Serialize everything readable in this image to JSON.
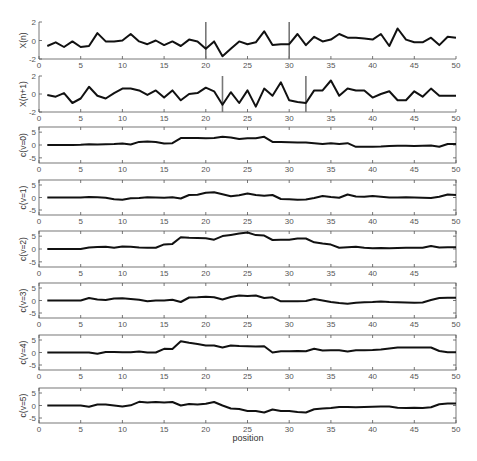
{
  "figure": {
    "xlabel": "position",
    "xlim": [
      0,
      50
    ],
    "xticks": [
      0,
      5,
      10,
      15,
      20,
      25,
      30,
      35,
      40,
      45,
      50
    ]
  },
  "chart_data": [
    {
      "type": "line",
      "title": "",
      "ylabel": "X(n)",
      "xlabel": "",
      "ylim": [
        -2,
        2
      ],
      "yticks": [
        -2,
        0,
        2
      ],
      "frame": "axes-only",
      "markers": [
        20,
        30
      ],
      "x": [
        1,
        2,
        3,
        4,
        5,
        6,
        7,
        8,
        9,
        10,
        11,
        12,
        13,
        14,
        15,
        16,
        17,
        18,
        19,
        20,
        21,
        22,
        23,
        24,
        25,
        26,
        27,
        28,
        29,
        30,
        31,
        32,
        33,
        34,
        35,
        36,
        37,
        38,
        39,
        40,
        41,
        42,
        43,
        44,
        45,
        46,
        47,
        48,
        49,
        50
      ],
      "values": [
        -0.6,
        -0.2,
        -0.7,
        -0.1,
        -0.7,
        -0.6,
        0.8,
        -0.1,
        -0.1,
        0.0,
        0.7,
        -0.1,
        -0.4,
        0.0,
        -0.5,
        -0.1,
        -0.6,
        0.1,
        -0.1,
        -0.9,
        -0.1,
        -1.7,
        -0.9,
        -0.1,
        -0.4,
        -0.2,
        1.0,
        -0.5,
        -0.4,
        -0.4,
        0.7,
        -0.5,
        0.4,
        -0.1,
        0.1,
        0.7,
        0.3,
        0.3,
        0.2,
        0.1,
        0.7,
        -0.6,
        1.3,
        0.1,
        -0.2,
        -0.2,
        0.3,
        -0.5,
        0.4,
        0.3
      ]
    },
    {
      "type": "line",
      "title": "",
      "ylabel": "X(n+1)",
      "xlabel": "",
      "ylim": [
        -2,
        2
      ],
      "yticks": [
        -2,
        0,
        2
      ],
      "frame": "axes-only",
      "markers": [
        22,
        32
      ],
      "x": [
        1,
        2,
        3,
        4,
        5,
        6,
        7,
        8,
        9,
        10,
        11,
        12,
        13,
        14,
        15,
        16,
        17,
        18,
        19,
        20,
        21,
        22,
        23,
        24,
        25,
        26,
        27,
        28,
        29,
        30,
        31,
        32,
        33,
        34,
        35,
        36,
        37,
        38,
        39,
        40,
        41,
        42,
        43,
        44,
        45,
        46,
        47,
        48,
        49,
        50
      ],
      "values": [
        -0.1,
        -0.3,
        0.1,
        -1.0,
        -0.5,
        0.8,
        -0.2,
        -0.5,
        0.1,
        0.6,
        0.6,
        0.4,
        -0.1,
        0.4,
        -0.4,
        0.4,
        -0.7,
        0.0,
        0.1,
        0.7,
        0.3,
        -1.2,
        0.2,
        -1.0,
        0.4,
        -1.4,
        0.6,
        -0.2,
        1.3,
        -0.7,
        -0.9,
        -1.0,
        0.4,
        0.4,
        1.5,
        -0.2,
        0.6,
        0.4,
        0.4,
        -0.4,
        0.0,
        0.3,
        -0.7,
        -0.7,
        0.3,
        -0.3,
        0.6,
        -0.2,
        -0.2,
        -0.2
      ]
    },
    {
      "type": "line",
      "title": "",
      "ylabel": "c(v=0)",
      "xlabel": "",
      "ylim": [
        -7,
        7
      ],
      "yticks": [
        -5,
        0,
        5
      ],
      "frame": "box",
      "markers": [],
      "x": [
        1,
        2,
        3,
        4,
        5,
        6,
        7,
        8,
        9,
        10,
        11,
        12,
        13,
        14,
        15,
        16,
        17,
        18,
        19,
        20,
        21,
        22,
        23,
        24,
        25,
        26,
        27,
        28,
        29,
        30,
        31,
        32,
        33,
        34,
        35,
        36,
        37,
        38,
        39,
        40,
        41,
        42,
        43,
        44,
        45,
        46,
        47,
        48,
        49,
        50
      ],
      "values": [
        0,
        0,
        0,
        0,
        0.1,
        0.3,
        0.2,
        0.3,
        0.4,
        0.6,
        0.2,
        1.2,
        1.4,
        1.2,
        0.6,
        0.7,
        2.7,
        2.7,
        2.7,
        2.6,
        2.7,
        3.2,
        2.9,
        2.3,
        2.6,
        2.6,
        3.2,
        1.2,
        1.2,
        1.1,
        1.0,
        1.0,
        0.7,
        0.4,
        0.7,
        0.4,
        0.7,
        -0.7,
        -0.7,
        -0.7,
        -0.6,
        -0.4,
        -0.3,
        -0.3,
        -0.4,
        -0.3,
        -0.2,
        -0.7,
        0.4,
        0.4
      ]
    },
    {
      "type": "line",
      "title": "",
      "ylabel": "c(v=1)",
      "xlabel": "",
      "ylim": [
        -7,
        7
      ],
      "yticks": [
        -5,
        0,
        5
      ],
      "frame": "box",
      "markers": [],
      "x": [
        1,
        2,
        3,
        4,
        5,
        6,
        7,
        8,
        9,
        10,
        11,
        12,
        13,
        14,
        15,
        16,
        17,
        18,
        19,
        20,
        21,
        22,
        23,
        24,
        25,
        26,
        27,
        28,
        29,
        30,
        31,
        32,
        33,
        34,
        35,
        36,
        37,
        38,
        39,
        40,
        41,
        42,
        43,
        44,
        45,
        46,
        47,
        48,
        49,
        50
      ],
      "values": [
        0,
        0,
        0,
        0,
        0,
        0.2,
        0.1,
        -0.1,
        -0.7,
        -0.9,
        -0.3,
        -0.2,
        0.1,
        0.0,
        -0.1,
        0.1,
        -0.4,
        1.0,
        1.1,
        1.9,
        2.1,
        1.3,
        0.5,
        0.9,
        1.6,
        1.0,
        0.7,
        1.0,
        -0.6,
        -0.7,
        -0.9,
        -0.8,
        -0.2,
        0.6,
        0.2,
        -0.1,
        1.2,
        0.4,
        0.3,
        0.6,
        0.3,
        0.0,
        0.0,
        0.1,
        0.0,
        -0.1,
        -0.2,
        0.3,
        1.2,
        1.0
      ]
    },
    {
      "type": "line",
      "title": "",
      "ylabel": "c(v=2)",
      "xlabel": "",
      "ylim": [
        -7,
        7
      ],
      "yticks": [
        -5,
        0,
        5
      ],
      "frame": "box",
      "markers": [],
      "x": [
        1,
        2,
        3,
        4,
        5,
        6,
        7,
        8,
        9,
        10,
        11,
        12,
        13,
        14,
        15,
        16,
        17,
        18,
        19,
        20,
        21,
        22,
        23,
        24,
        25,
        26,
        27,
        28,
        29,
        30,
        31,
        32,
        33,
        34,
        35,
        36,
        37,
        38,
        39,
        40,
        41,
        42,
        43,
        44,
        45,
        46,
        47,
        48,
        49,
        50
      ],
      "values": [
        0,
        0,
        0,
        0,
        0,
        0.6,
        0.8,
        0.9,
        0.5,
        1.0,
        0.9,
        0.6,
        0.5,
        0.5,
        1.8,
        2.0,
        4.6,
        4.4,
        4.3,
        4.2,
        3.6,
        5.0,
        5.5,
        6.0,
        6.4,
        5.4,
        5.2,
        3.5,
        3.6,
        3.6,
        4.1,
        4.1,
        2.6,
        2.1,
        1.7,
        0.5,
        0.7,
        0.9,
        0.5,
        0.3,
        0.4,
        0.3,
        0.4,
        0.5,
        0.5,
        0.5,
        1.2,
        0.6,
        0.7,
        0.7
      ]
    },
    {
      "type": "line",
      "title": "",
      "ylabel": "c(v=3)",
      "xlabel": "",
      "ylim": [
        -7,
        7
      ],
      "yticks": [
        -5,
        0,
        5
      ],
      "frame": "box",
      "markers": [],
      "x": [
        1,
        2,
        3,
        4,
        5,
        6,
        7,
        8,
        9,
        10,
        11,
        12,
        13,
        14,
        15,
        16,
        17,
        18,
        19,
        20,
        21,
        22,
        23,
        24,
        25,
        26,
        27,
        28,
        29,
        30,
        31,
        32,
        33,
        34,
        35,
        36,
        37,
        38,
        39,
        40,
        41,
        42,
        43,
        44,
        45,
        46,
        47,
        48,
        49,
        50
      ],
      "values": [
        0,
        0,
        0,
        0,
        0,
        1.0,
        0.4,
        0.2,
        0.8,
        0.9,
        0.6,
        0.3,
        -0.3,
        0,
        0,
        0.3,
        -0.6,
        1.2,
        1.3,
        1.5,
        1.3,
        0.4,
        1.4,
        2.0,
        1.8,
        2.0,
        1.0,
        1.3,
        -0.3,
        -0.3,
        -0.3,
        -0.2,
        0.6,
        0,
        -0.6,
        -1.0,
        -1.3,
        -0.9,
        -0.7,
        -0.6,
        -0.4,
        -0.6,
        -0.7,
        -0.8,
        -0.9,
        -0.8,
        0.2,
        1.0,
        1.1,
        1.1
      ]
    },
    {
      "type": "line",
      "title": "",
      "ylabel": "c(v=4)",
      "xlabel": "",
      "ylim": [
        -7,
        7
      ],
      "yticks": [
        -5,
        0,
        5
      ],
      "frame": "box",
      "markers": [],
      "x": [
        1,
        2,
        3,
        4,
        5,
        6,
        7,
        8,
        9,
        10,
        11,
        12,
        13,
        14,
        15,
        16,
        17,
        18,
        19,
        20,
        21,
        22,
        23,
        24,
        25,
        26,
        27,
        28,
        29,
        30,
        31,
        32,
        33,
        34,
        35,
        36,
        37,
        38,
        39,
        40,
        41,
        42,
        43,
        44,
        45,
        46,
        47,
        48,
        49,
        50
      ],
      "values": [
        0,
        0,
        0,
        0,
        0,
        0,
        -0.5,
        0.2,
        0.2,
        0.1,
        0.1,
        0.4,
        0.0,
        0.0,
        1.5,
        1.4,
        4.5,
        3.9,
        3.4,
        2.8,
        2.8,
        2.0,
        2.8,
        2.6,
        2.5,
        2.4,
        2.5,
        0.0,
        0.5,
        0.5,
        0.6,
        0.5,
        1.5,
        0.8,
        0.9,
        0.9,
        0.4,
        0.9,
        0.9,
        1.0,
        1.2,
        1.6,
        2.0,
        2.0,
        2.0,
        2.0,
        2.0,
        0.6,
        0.1,
        0.1
      ]
    },
    {
      "type": "line",
      "title": "",
      "ylabel": "c(v=5)",
      "xlabel": "position",
      "ylim": [
        -7,
        7
      ],
      "yticks": [
        -5,
        0,
        5
      ],
      "frame": "box",
      "markers": [],
      "x": [
        1,
        2,
        3,
        4,
        5,
        6,
        7,
        8,
        9,
        10,
        11,
        12,
        13,
        14,
        15,
        16,
        17,
        18,
        19,
        20,
        21,
        22,
        23,
        24,
        25,
        26,
        27,
        28,
        29,
        30,
        31,
        32,
        33,
        34,
        35,
        36,
        37,
        38,
        39,
        40,
        41,
        42,
        43,
        44,
        45,
        46,
        47,
        48,
        49,
        50
      ],
      "values": [
        0,
        0,
        0,
        0,
        0,
        -0.5,
        0.4,
        0.4,
        0.0,
        -0.4,
        0.1,
        1.5,
        1.2,
        1.4,
        1.2,
        1.4,
        0.0,
        0.6,
        0.4,
        0.7,
        1.4,
        0.0,
        -1.2,
        -1.4,
        -2.2,
        -2.2,
        -2.8,
        -1.6,
        -2.2,
        -2.2,
        -2.6,
        -2.8,
        -1.5,
        -1.2,
        -1.0,
        -0.6,
        -0.6,
        -0.7,
        -0.6,
        -0.5,
        -0.4,
        -0.4,
        -0.9,
        -1.0,
        -0.9,
        -1.0,
        -0.7,
        0.5,
        0.8,
        0.8
      ]
    }
  ],
  "panels": [
    {
      "name": "x-n",
      "top": 22,
      "bottom": 59
    },
    {
      "name": "x-n-plus-1",
      "top": 76,
      "bottom": 112
    },
    {
      "name": "c-v0",
      "top": 127,
      "bottom": 163
    },
    {
      "name": "c-v1",
      "top": 180,
      "bottom": 215
    },
    {
      "name": "c-v2",
      "top": 231,
      "bottom": 267
    },
    {
      "name": "c-v3",
      "top": 283,
      "bottom": 318
    },
    {
      "name": "c-v4",
      "top": 335,
      "bottom": 370
    },
    {
      "name": "c-v5",
      "top": 388,
      "bottom": 423
    }
  ],
  "colors": {
    "line": "#111111",
    "marker": "#777777",
    "axis": "#555555",
    "tick_text": "#555555"
  }
}
